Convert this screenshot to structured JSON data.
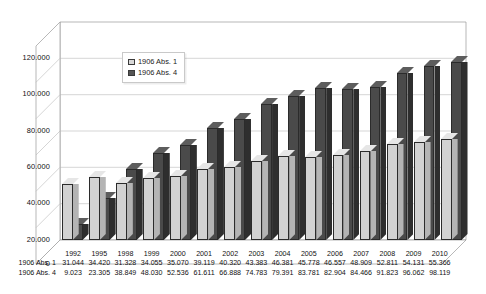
{
  "chart_data": {
    "type": "bar",
    "title": "",
    "xlabel": "",
    "ylabel": "",
    "ylim": [
      0,
      120000
    ],
    "yticks": [
      "0",
      "20.000",
      "40.000",
      "60.000",
      "80.000",
      "100.000",
      "120.000"
    ],
    "grid": true,
    "legend_position": "upper-left-inside",
    "three_d": true,
    "categories": [
      "1992",
      "1995",
      "1998",
      "1999",
      "2000",
      "2001",
      "2002",
      "2003",
      "2004",
      "2005",
      "2006",
      "2007",
      "2008",
      "2009",
      "2010"
    ],
    "series": [
      {
        "name": "1906 Abs. 1",
        "color": "#d2d2d2",
        "values_text": [
          "31.044",
          "34.420",
          "31.328",
          "34.055",
          "35.070",
          "39.119",
          "40.320",
          "43.383",
          "46.381",
          "45.778",
          "46.557",
          "48.909",
          "52.811",
          "54.131",
          "55.366"
        ],
        "values": [
          31044,
          34420,
          31328,
          34055,
          35070,
          39119,
          40320,
          43383,
          46381,
          45778,
          46557,
          48909,
          52811,
          54131,
          55366
        ]
      },
      {
        "name": "1906 Abs. 4",
        "color": "#4a4a4a",
        "values_text": [
          "9.023",
          "23.305",
          "38.849",
          "48.030",
          "52.536",
          "61.611",
          "66.888",
          "74.783",
          "79.391",
          "83.781",
          "82.904",
          "84.466",
          "91.823",
          "96.062",
          "98.119"
        ],
        "values": [
          9023,
          23305,
          38849,
          48030,
          52536,
          61611,
          66888,
          74783,
          79391,
          83781,
          82904,
          84466,
          91823,
          96062,
          98119
        ]
      }
    ]
  },
  "legend": {
    "items": [
      {
        "label": "1906 Abs. 1"
      },
      {
        "label": "1906 Abs. 4"
      }
    ]
  },
  "table": {
    "year_row_label": "",
    "rows": [
      {
        "label": "1906 Abs. 1"
      },
      {
        "label": "1906 Abs. 4"
      }
    ]
  }
}
